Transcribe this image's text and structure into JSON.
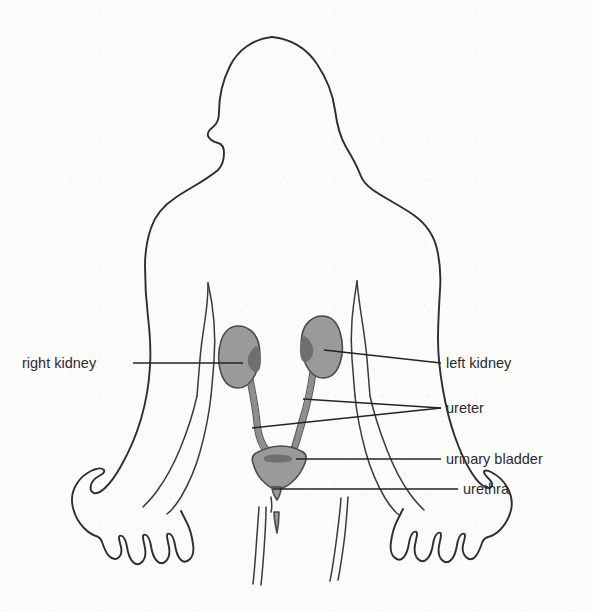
{
  "figure": {
    "view": "posterior (back) view of human body outline",
    "background_color": "#fbfbfa",
    "outline_color": "#2e2e2e",
    "organ_color": "#9a9a9a",
    "label_color": "#2b2b2b"
  },
  "labels": [
    {
      "id": "right-kidney",
      "text": "right kidney",
      "side": "left",
      "text_x": 22,
      "text_y": 368,
      "anchor": "start",
      "leader_y": 363
    },
    {
      "id": "left-kidney",
      "text": "left kidney",
      "side": "right",
      "text_x": 446,
      "text_y": 368,
      "anchor": "start",
      "leader_y": 363
    },
    {
      "id": "ureter",
      "text": "ureter",
      "side": "right",
      "text_x": 446,
      "text_y": 413,
      "anchor": "start",
      "leader_y": 408
    },
    {
      "id": "urinary-bladder",
      "text": "urinary bladder",
      "side": "right",
      "text_x": 446,
      "text_y": 464,
      "anchor": "start",
      "leader_y": 459
    },
    {
      "id": "urethra",
      "text": "urethra",
      "side": "right",
      "text_x": 463,
      "text_y": 494,
      "anchor": "start",
      "leader_y": 489
    }
  ],
  "organs": [
    {
      "id": "right-kidney",
      "name": "right kidney",
      "cx": 240,
      "cy": 357
    },
    {
      "id": "left-kidney",
      "name": "left kidney",
      "cx": 320,
      "cy": 347
    },
    {
      "id": "right-ureter",
      "name": "right ureter"
    },
    {
      "id": "left-ureter",
      "name": "left ureter"
    },
    {
      "id": "urinary-bladder",
      "name": "urinary bladder",
      "cx": 279,
      "cy": 462
    },
    {
      "id": "urethra",
      "name": "urethra",
      "cx": 276,
      "cy": 487
    }
  ]
}
